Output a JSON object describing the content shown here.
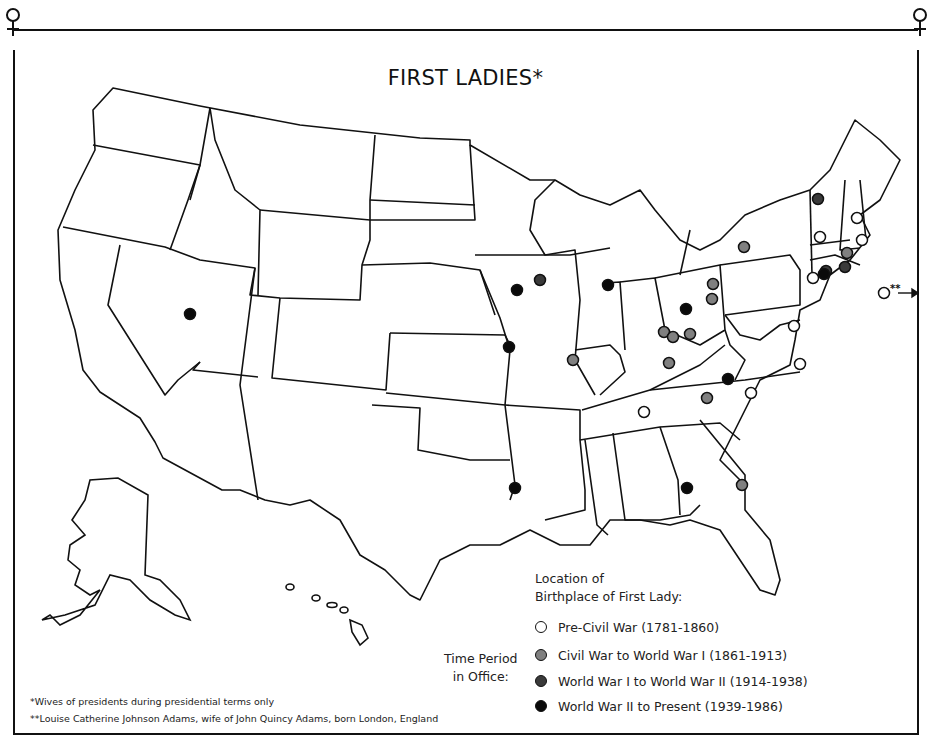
{
  "title": "FIRST LADIES*",
  "legend": {
    "heading_line1": "Location of",
    "heading_line2": "Birthplace of First Lady:",
    "side_label_line1": "Time Period",
    "side_label_line2": "in Office:",
    "items": [
      {
        "label": "Pre-Civil War (1781-1860)",
        "color": "#ffffff"
      },
      {
        "label": "Civil War to World War I (1861-1913)",
        "color": "#808080"
      },
      {
        "label": "World War I to World War II (1914-1938)",
        "color": "#3a3a3a"
      },
      {
        "label": "World War II to Present (1939-1986)",
        "color": "#0a0a0a"
      }
    ]
  },
  "footnotes": {
    "single": "*Wives of presidents during presidential terms only",
    "double": "**Louise Catherine Johnson Adams, wife of John Quincy Adams, born London, England"
  },
  "outside_marker": {
    "label": "**",
    "period": "Pre-Civil War (1781-1860)"
  },
  "frame_symbols": {
    "left": "venus-symbol",
    "right": "venus-symbol"
  },
  "chart_data": {
    "type": "scatter",
    "title": "FIRST LADIES*",
    "subtitle": "Location of Birthplace of First Lady, by Time Period in Office",
    "legend_position": "bottom-center",
    "categories": [
      "Pre-Civil War (1781-1860)",
      "Civil War to World War I (1861-1913)",
      "World War I to World War II (1914-1938)",
      "World War II to Present (1939-1986)"
    ],
    "series": [
      {
        "name": "Pre-Civil War (1781-1860)",
        "fill": "#ffffff",
        "points": [
          [
            857,
            218
          ],
          [
            820,
            237
          ],
          [
            862,
            240
          ],
          [
            813,
            278
          ],
          [
            794,
            326
          ],
          [
            800,
            364
          ],
          [
            751,
            393
          ],
          [
            644,
            412
          ],
          [
            884,
            293
          ]
        ]
      },
      {
        "name": "Civil War to World War I (1861-1913)",
        "fill": "#808080",
        "points": [
          [
            744,
            247
          ],
          [
            847,
            253
          ],
          [
            713,
            284
          ],
          [
            712,
            299
          ],
          [
            664,
            332
          ],
          [
            673,
            337
          ],
          [
            690,
            334
          ],
          [
            669,
            363
          ],
          [
            573,
            360
          ],
          [
            707,
            398
          ],
          [
            742,
            485
          ]
        ]
      },
      {
        "name": "World War I to World War II (1914-1938)",
        "fill": "#3a3a3a",
        "points": [
          [
            540,
            280
          ],
          [
            818,
            199
          ],
          [
            845,
            267
          ],
          [
            826,
            271
          ]
        ]
      },
      {
        "name": "World War II to Present (1939-1986)",
        "fill": "#0a0a0a",
        "points": [
          [
            190,
            314
          ],
          [
            517,
            290
          ],
          [
            608,
            285
          ],
          [
            509,
            347
          ],
          [
            686,
            309
          ],
          [
            728,
            379
          ],
          [
            824,
            274
          ],
          [
            687,
            488
          ],
          [
            515,
            488
          ]
        ]
      }
    ],
    "annotations": [
      "** Louise Catherine Johnson Adams, born London, England (marker off east coast)"
    ]
  }
}
